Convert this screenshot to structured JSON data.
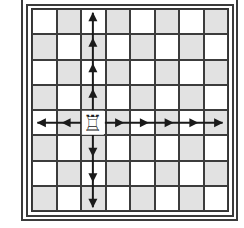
{
  "diagram": {
    "type": "chessboard-move-diagram",
    "board": {
      "files": 8,
      "ranks": 8,
      "light_color": "#ffffff",
      "dark_color": "#e2e2e2",
      "line_color": "#333333"
    },
    "piece": {
      "name": "rook",
      "color": "white",
      "glyph": "♖",
      "col": 2,
      "row": 4
    },
    "arrows": {
      "color": "#1a1a1a",
      "up": {
        "from_row": 4,
        "to_row": 0,
        "arrowheads_at_rows": [
          0,
          1,
          2,
          3
        ]
      },
      "down": {
        "from_row": 4,
        "to_row": 7,
        "arrowheads_at_rows": [
          5,
          6,
          7
        ]
      },
      "left": {
        "from_col": 2,
        "to_col": 0,
        "arrowheads_at_cols": [
          0,
          1
        ]
      },
      "right": {
        "from_col": 2,
        "to_col": 7,
        "arrowheads_at_cols": [
          3,
          4,
          5,
          6,
          7
        ]
      }
    }
  }
}
